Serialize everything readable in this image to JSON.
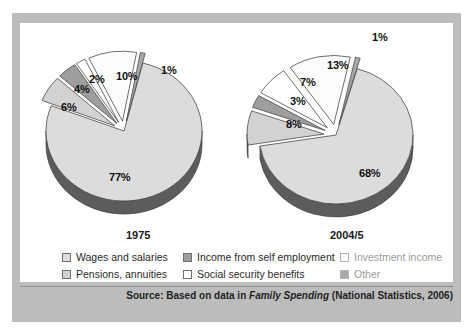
{
  "figure": {
    "frame_color": "#bcbcbc",
    "panel_color": "#ffffff"
  },
  "charts": [
    {
      "name": "pie-1975",
      "year_label": "1975",
      "labels": [
        "77%",
        "6%",
        "4%",
        "2%",
        "10%",
        "1%"
      ]
    },
    {
      "name": "pie-2004-5",
      "year_label": "2004/5",
      "labels": [
        "68%",
        "8%",
        "3%",
        "7%",
        "13%",
        "1%"
      ]
    }
  ],
  "legend": {
    "columns": [
      [
        {
          "label": "Wages and salaries",
          "swatch": "#dcdcdc",
          "faded": false
        },
        {
          "label": "Pensions, annuities",
          "swatch": "#d2d2d2",
          "faded": false
        }
      ],
      [
        {
          "label": "Income from self employment",
          "swatch": "#9e9e9e",
          "faded": false
        },
        {
          "label": "Social security benefits",
          "swatch": "#ffffff",
          "faded": false
        }
      ],
      [
        {
          "label": "Investment income",
          "swatch": "#fbfbfb",
          "faded": true
        },
        {
          "label": "Other",
          "swatch": "#a8a8a8",
          "faded": true
        }
      ]
    ]
  },
  "source": {
    "prefix": "Source: Based on data in ",
    "italic": "Family Spending",
    "suffix": " (National Statistics, 2006)"
  },
  "chart_data": {
    "type": "pie",
    "title": "",
    "subtitle": "",
    "xlabel": "",
    "ylabel": "",
    "legend_position": "bottom",
    "grid": false,
    "units": "percent of household income",
    "categories": [
      "Wages and salaries",
      "Pensions, annuities",
      "Income from self employment",
      "Social security benefits",
      "Investment income",
      "Other"
    ],
    "category_colors": [
      "#dcdcdc",
      "#d2d2d2",
      "#9e9e9e",
      "#ffffff",
      "#fbfbfb",
      "#a8a8a8"
    ],
    "series": [
      {
        "name": "1975",
        "values": [
          77,
          6,
          4,
          2,
          10,
          1
        ],
        "slice_labels": [
          "77%",
          "6%",
          "4%",
          "2%",
          "10%",
          "1%"
        ],
        "exploded": [
          false,
          true,
          true,
          true,
          true,
          true
        ]
      },
      {
        "name": "2004/5",
        "values": [
          68,
          8,
          3,
          7,
          13,
          1
        ],
        "slice_labels": [
          "68%",
          "8%",
          "3%",
          "7%",
          "13%",
          "1%"
        ],
        "exploded": [
          false,
          true,
          true,
          true,
          true,
          true
        ]
      }
    ],
    "annotations": [
      "Source: Based on data in Family Spending (National Statistics, 2006)"
    ]
  }
}
